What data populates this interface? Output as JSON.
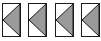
{
  "buttons": [
    {
      "icon": "triangle-left-icon",
      "direction": "left"
    },
    {
      "icon": "triangle-left-icon",
      "direction": "left"
    },
    {
      "icon": "triangle-left-icon",
      "direction": "left"
    },
    {
      "icon": "triangle-left-icon",
      "direction": "left"
    }
  ],
  "colors": {
    "fill": "#9a9a9a",
    "border": "#1a1a1a",
    "background": "#ffffff"
  }
}
